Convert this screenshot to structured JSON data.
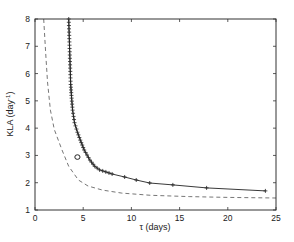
{
  "chart_data": {
    "type": "line",
    "title": "",
    "xlabel": "τ (days)",
    "ylabel": "KLA (day⁻¹)",
    "ylabel_parts": {
      "main": "KLA (day",
      "sup": "-1",
      "end": ")"
    },
    "xlim": [
      0,
      25
    ],
    "ylim": [
      1,
      8
    ],
    "xticks": [
      0,
      5,
      10,
      15,
      20,
      25
    ],
    "yticks": [
      1,
      2,
      3,
      4,
      5,
      6,
      7,
      8
    ],
    "grid": false,
    "legend": null,
    "annotations": [
      {
        "text": "Q",
        "x": 4.4,
        "y": 2.94,
        "marker": "circle"
      }
    ],
    "series": [
      {
        "name": "marked curve",
        "style": "solid",
        "marker": "+",
        "color": "#222222",
        "x": [
          3.5,
          3.55,
          3.6,
          3.65,
          3.7,
          3.8,
          3.9,
          4.1,
          4.4,
          4.7,
          5.1,
          5.7,
          6.2,
          6.7,
          8.0,
          9.3,
          10.5,
          11.9,
          14.3,
          17.8,
          23.9
        ],
        "y": [
          8.0,
          7.4,
          6.8,
          6.2,
          5.6,
          5.1,
          4.66,
          4.2,
          3.85,
          3.56,
          3.2,
          2.83,
          2.6,
          2.47,
          2.32,
          2.21,
          2.1,
          1.99,
          1.92,
          1.81,
          1.7
        ]
      },
      {
        "name": "dashed curve",
        "style": "dashed",
        "marker": "none",
        "color": "#666666",
        "x": [
          0.9,
          1.1,
          1.3,
          1.6,
          2.0,
          2.8,
          3.5,
          4.5,
          5.5,
          7.0,
          9.0,
          12.0,
          16.0,
          20.0,
          25.0
        ],
        "y": [
          8.0,
          6.8,
          5.7,
          4.66,
          3.95,
          3.2,
          2.6,
          2.1,
          1.88,
          1.73,
          1.62,
          1.54,
          1.49,
          1.46,
          1.44
        ]
      }
    ]
  }
}
